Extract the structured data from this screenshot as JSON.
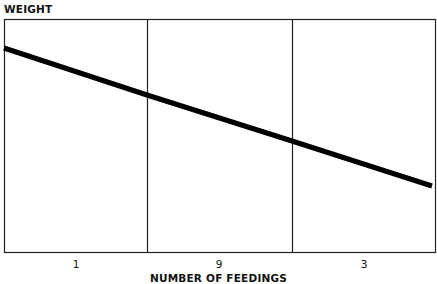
{
  "chart_data": {
    "type": "line",
    "title": "",
    "ylabel": "WEIGHT",
    "xlabel": "NUMBER OF FEEDINGS",
    "categories": [
      "1",
      "9",
      "3"
    ],
    "series": [
      {
        "name": "Weight",
        "x_px": [
          4,
          147,
          292,
          432
        ],
        "y_px": [
          48,
          95,
          141,
          186
        ]
      }
    ],
    "grid": {
      "vertical_dividers": true,
      "horizontal": false
    },
    "y_ticks": [],
    "trend": "linear decreasing"
  },
  "labels": {
    "y": "WEIGHT",
    "x": "NUMBER OF FEEDINGS",
    "ticks": [
      "1",
      "9",
      "3"
    ]
  },
  "colors": {
    "line": "#000000",
    "frame": "#222222",
    "background": "#ffffff"
  }
}
